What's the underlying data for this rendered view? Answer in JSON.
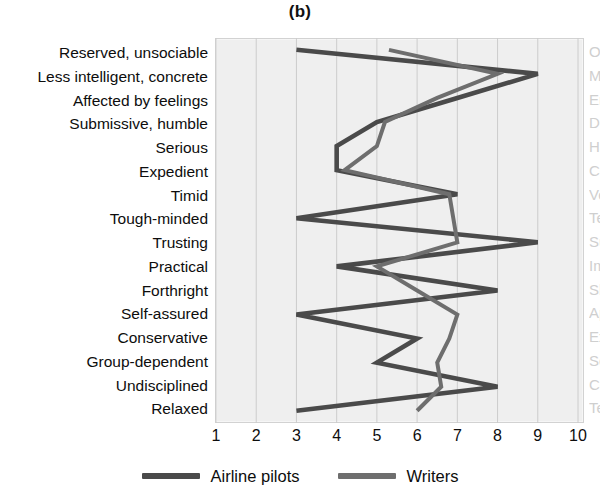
{
  "chart": {
    "title": "(b)",
    "x_ticks": [
      1,
      2,
      3,
      4,
      5,
      6,
      7,
      8,
      9,
      10
    ],
    "legend": [
      {
        "label": "Airline pilots",
        "color": "#4a4a4a"
      },
      {
        "label": "Writers",
        "color": "#6e6e6e"
      }
    ]
  },
  "chart_data": {
    "type": "line",
    "orientation": "horizontal",
    "title": "(b)",
    "xlabel": "",
    "ylabel": "",
    "xlim": [
      1,
      10
    ],
    "grid": true,
    "legend_position": "bottom",
    "categories": [
      "Reserved, unsociable",
      "Less intelligent, concrete",
      "Affected by feelings",
      "Submissive, humble",
      "Serious",
      "Expedient",
      "Timid",
      "Tough-minded",
      "Trusting",
      "Practical",
      "Forthright",
      "Self-assured",
      "Conservative",
      "Group-dependent",
      "Undisciplined",
      "Relaxed"
    ],
    "right_categories": [
      "Outgoing, participating",
      "More intelligent, abstract",
      "Emotionally stable",
      "Dominant, assertive",
      "Happy-go-lucky",
      "Conscientious",
      "Venturesome",
      "Tender-minded",
      "Suspicious",
      "Imaginative",
      "Shrewd",
      "Apprehensive",
      "Experimenting",
      "Self-sufficient",
      "Controlled",
      "Tense"
    ],
    "series": [
      {
        "name": "Airline pilots",
        "color": "#4a4a4a",
        "values": [
          3,
          9,
          7,
          5,
          4,
          4,
          7,
          3,
          9,
          4,
          8,
          3,
          6,
          5,
          8,
          3
        ]
      },
      {
        "name": "Writers",
        "color": "#6e6e6e",
        "values": [
          5.3,
          8,
          6.5,
          5.2,
          5,
          4.2,
          6.8,
          6.9,
          7,
          5,
          6,
          7,
          6.8,
          6.5,
          6.6,
          6
        ]
      }
    ]
  }
}
